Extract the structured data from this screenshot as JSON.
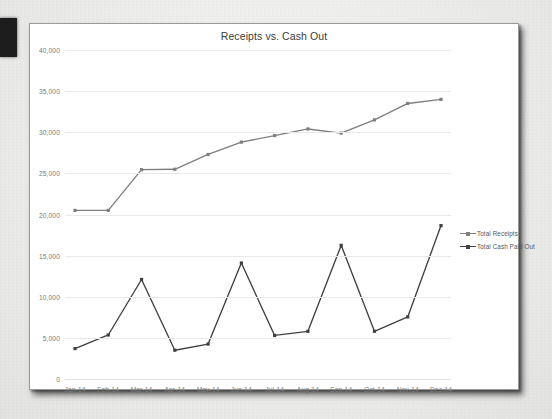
{
  "chart_data": {
    "type": "line",
    "title": "Receipts vs. Cash Out",
    "xlabel": "",
    "ylabel": "",
    "grid": true,
    "legend_position": "right",
    "ylim": [
      0,
      40000
    ],
    "ytick_labels": [
      "40,000",
      "35,000",
      "30,000",
      "25,000",
      "20,000",
      "15,000",
      "10,000",
      "5,000",
      "0"
    ],
    "ytick_values": [
      40000,
      35000,
      30000,
      25000,
      20000,
      15000,
      10000,
      5000,
      0
    ],
    "categories": [
      "Jan-14",
      "Feb-14",
      "Mar-14",
      "Apr-14",
      "May-14",
      "Jun-14",
      "Jul-14",
      "Aug-14",
      "Sep-14",
      "Oct-14",
      "Nov-14",
      "Dec-14"
    ],
    "series": [
      {
        "name": "Total Receipts",
        "color": "#7f7f7f",
        "values": [
          20500,
          20500,
          25450,
          25500,
          27300,
          28800,
          29600,
          30400,
          29900,
          31500,
          33500,
          34000
        ]
      },
      {
        "name": "Total Cash Paid Out",
        "color": "#404040",
        "values": [
          3700,
          5350,
          12100,
          3500,
          4250,
          14100,
          5300,
          5800,
          16250,
          5800,
          7550,
          18650
        ]
      }
    ]
  },
  "legend": {
    "items": [
      {
        "label": "Total Receipts",
        "color": "#7f7f7f"
      },
      {
        "label": "Total Cash Paid Out",
        "color": "#404040"
      }
    ]
  },
  "colors": {
    "receipts": "#7f7f7f",
    "cash_paid_out": "#404040",
    "gridline": "#e9e9e9",
    "card_background": "#ffffff",
    "page_background": "#ececeb",
    "axis_text": "#7b7b7b",
    "title_text": "#3b3b3b"
  }
}
